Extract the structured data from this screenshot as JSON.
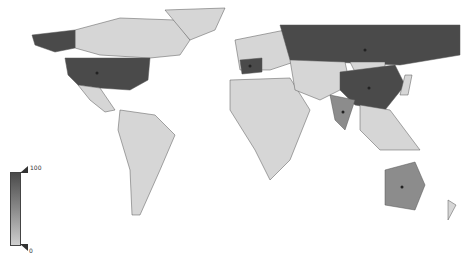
{
  "map": {
    "type": "choropleth",
    "projection": "world",
    "colors": {
      "low": "#d6d6d6",
      "mid": "#8c8c8c",
      "high": "#4a4a4a",
      "border": "#555555"
    },
    "highlighted_countries": [
      {
        "name": "United States",
        "shade": "high",
        "marker": true
      },
      {
        "name": "Alaska",
        "shade": "high",
        "marker": false
      },
      {
        "name": "Russia",
        "shade": "high",
        "marker": true
      },
      {
        "name": "China",
        "shade": "high",
        "marker": true
      },
      {
        "name": "India",
        "shade": "mid",
        "marker": true
      },
      {
        "name": "Australia",
        "shade": "mid",
        "marker": true
      },
      {
        "name": "Western Europe",
        "shade": "high",
        "marker": true
      }
    ]
  },
  "legend": {
    "max_label": "100",
    "min_label": "0"
  }
}
